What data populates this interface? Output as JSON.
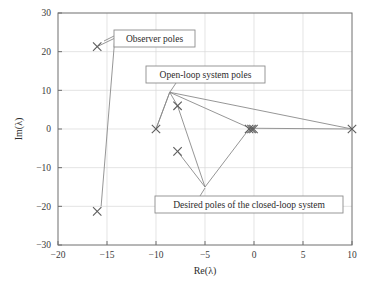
{
  "chart_data": {
    "type": "scatter",
    "title": "",
    "xlabel": "Re(λ)",
    "ylabel": "Im(λ)",
    "xlim": [
      -20,
      10
    ],
    "ylim": [
      -30,
      30
    ],
    "xticks": [
      "−20",
      "−15",
      "−10",
      "−5",
      "0",
      "5",
      "10"
    ],
    "xtick_values": [
      -20,
      -15,
      -10,
      -5,
      0,
      5,
      10
    ],
    "yticks": [
      "30",
      "20",
      "10",
      "0",
      "−10",
      "−20",
      "−30"
    ],
    "ytick_values": [
      30,
      20,
      10,
      0,
      -10,
      -20,
      -30
    ],
    "grid": true,
    "legend": "none",
    "marker": "x",
    "series": [
      {
        "name": "Observer poles",
        "points": [
          {
            "re": -16.0,
            "im": 21.3
          },
          {
            "re": -16.0,
            "im": -21.3
          }
        ]
      },
      {
        "name": "Open-loop system poles",
        "points": [
          {
            "re": -10.0,
            "im": 0.0
          },
          {
            "re": -7.8,
            "im": 6.0
          },
          {
            "re": -7.8,
            "im": -5.8
          },
          {
            "re": 10.0,
            "im": 0.0
          }
        ]
      },
      {
        "name": "Desired poles of the closed-loop system",
        "points": [
          {
            "re": -0.5,
            "im": 0.0
          },
          {
            "re": -0.25,
            "im": 0.0
          },
          {
            "re": -0.05,
            "im": 0.0
          }
        ]
      }
    ],
    "connector_paths": [
      {
        "name": "observer-pole-connector",
        "points": [
          {
            "re": -16.0,
            "im": 21.3
          },
          {
            "re": -14.2,
            "im": 23.5
          },
          {
            "re": -15.6,
            "im": -20.0
          }
        ]
      },
      {
        "name": "open-loop-connector",
        "points": [
          {
            "re": -8.6,
            "im": 9.5
          },
          {
            "re": -10.0,
            "im": 0.0
          },
          {
            "re": -8.6,
            "im": 9.5
          },
          {
            "re": -7.8,
            "im": 6.0
          },
          {
            "re": -5.0,
            "im": -15.0
          },
          {
            "re": -7.8,
            "im": -5.8
          }
        ]
      },
      {
        "name": "closed-loop-connector",
        "points": [
          {
            "re": -8.6,
            "im": 9.5
          },
          {
            "re": 10.0,
            "im": 0.0
          },
          {
            "re": -0.4,
            "im": 0.2
          },
          {
            "re": -8.6,
            "im": 9.5
          }
        ]
      },
      {
        "name": "desired-pole-connector",
        "points": [
          {
            "re": -5.0,
            "im": -15.0
          },
          {
            "re": -0.5,
            "im": 0.0
          }
        ]
      }
    ],
    "annotations": [
      {
        "id": "observer-poles",
        "label": "Observer poles",
        "box_px": {
          "x": 114,
          "y": 30,
          "w": 81,
          "h": 17
        },
        "leader_px": [
          {
            "x": 114,
            "y": 36
          },
          {
            "x": 104,
            "y": 41
          }
        ]
      },
      {
        "id": "open-loop-system-poles",
        "label": "Open-loop system poles",
        "box_px": {
          "x": 146,
          "y": 66,
          "w": 119,
          "h": 17
        },
        "leader_px": [
          {
            "x": 176,
            "y": 83
          },
          {
            "x": 170,
            "y": 92
          }
        ]
      },
      {
        "id": "desired-poles-closed-loop",
        "label": "Desired poles of the closed-loop system",
        "box_px": {
          "x": 155,
          "y": 196,
          "w": 188,
          "h": 17
        },
        "leader_px": [
          {
            "x": 200,
            "y": 196
          },
          {
            "x": 205,
            "y": 188
          }
        ]
      }
    ]
  },
  "colors": {
    "frame": "#6e6e6e",
    "grid": "#d8d8d8",
    "marker": "#5c5c5c",
    "line": "#8a8a8a",
    "text": "#2b2b2b",
    "background": "#ffffff"
  }
}
